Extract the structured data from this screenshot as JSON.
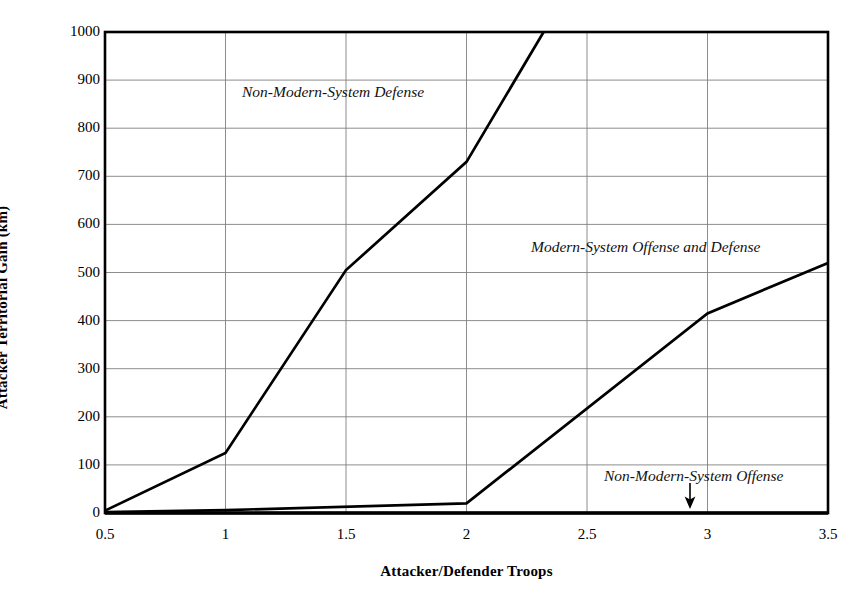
{
  "chart_data": {
    "type": "line",
    "title": "",
    "xlabel": "Attacker/Defender Troops",
    "ylabel": "Attacker Territorial Gain (km)",
    "xlim": [
      0.5,
      3.5
    ],
    "ylim": [
      0,
      1000
    ],
    "grid": true,
    "legend_position": "inline-annotations",
    "xticks": [
      "0.5",
      "1",
      "1.5",
      "2",
      "2.5",
      "3",
      "3.5"
    ],
    "xtick_values": [
      0.5,
      1,
      1.5,
      2,
      2.5,
      3,
      3.5
    ],
    "yticks": [
      "0",
      "100",
      "200",
      "300",
      "400",
      "500",
      "600",
      "700",
      "800",
      "900",
      "1000"
    ],
    "ytick_values": [
      0,
      100,
      200,
      300,
      400,
      500,
      600,
      700,
      800,
      900,
      1000
    ],
    "series": [
      {
        "name": "Non-Modern-System Defense",
        "x": [
          0.5,
          1.0,
          1.5,
          2.0,
          2.32
        ],
        "values": [
          5,
          125,
          505,
          730,
          1000
        ]
      },
      {
        "name": "Modern-System Offense and Defense",
        "x": [
          0.5,
          1.0,
          2.0,
          3.0,
          3.5
        ],
        "values": [
          2,
          6,
          20,
          415,
          520
        ]
      },
      {
        "name": "Non-Modern-System Offense",
        "x": [
          0.5,
          3.5
        ],
        "values": [
          0,
          0
        ]
      }
    ],
    "annotations": [
      {
        "text": "Non-Modern-System Defense",
        "target_series": "Non-Modern-System Defense"
      },
      {
        "text": "Modern-System Offense and Defense",
        "target_series": "Modern-System Offense and Defense"
      },
      {
        "text": "Non-Modern-System Offense",
        "target_series": "Non-Modern-System Offense",
        "arrow": "down-arrow"
      }
    ],
    "colors": {
      "line": "#000000",
      "grid": "#808080",
      "frame": "#000000",
      "background": "#ffffff"
    }
  },
  "axes": {
    "y_title": "Attacker Territorial Gain (km)",
    "x_title": "Attacker/Defender Troops",
    "x_tick_labels": [
      "0.5",
      "1",
      "1.5",
      "2",
      "2.5",
      "3",
      "3.5"
    ],
    "y_tick_labels": [
      "1000",
      "900",
      "800",
      "700",
      "600",
      "500",
      "400",
      "300",
      "200",
      "100",
      "0"
    ]
  },
  "labels": {
    "non_modern_system_defense": "Non-Modern-System Defense",
    "modern_system_offense_and_defense": "Modern-System Offense and Defense",
    "non_modern_system_offense": "Non-Modern-System Offense"
  }
}
